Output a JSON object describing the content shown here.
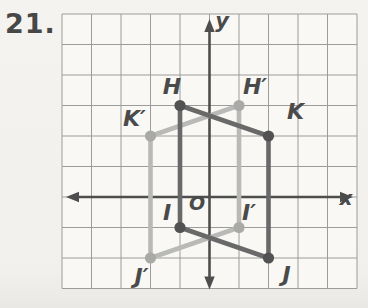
{
  "problem_number": "21.",
  "colors": {
    "page_bg": "#f1f0ed",
    "grid_bg": "#f9f8f5",
    "grid_line": "#9c9c9a",
    "axis": "#4e4e4e",
    "label": "#4a4a4a",
    "preimage_line": "#696969",
    "preimage_dot": "#525252",
    "image_line": "#b9b9b7",
    "image_dot": "#a9a9a7"
  },
  "figure": {
    "grid": {
      "cols": 10,
      "rows": 9,
      "left": 62,
      "top": 14,
      "cell_w": 29.5,
      "cell_h": 30.5,
      "origin_col": 5,
      "origin_row": 6,
      "x_range": [
        -5,
        5
      ],
      "y_range": [
        -3,
        6
      ]
    },
    "axes": {
      "x_label": "x",
      "y_label": "y",
      "origin_label": "O",
      "x_label_pos": [
        346,
        205
      ],
      "y_label_pos": [
        222,
        28
      ],
      "origin_label_pos": [
        197,
        210
      ]
    },
    "shapes": [
      {
        "id": "image-quad",
        "role": "reflected image H'K'J'I'",
        "line_color_key": "image_line",
        "dot_color_key": "image_dot",
        "points": [
          {
            "label": "H′",
            "x": 1,
            "y": 3,
            "label_offset": [
              16,
              -19
            ]
          },
          {
            "label": "K′",
            "x": -2,
            "y": 2,
            "label_offset": [
              -16,
              -18
            ]
          },
          {
            "label": "J′",
            "x": -2,
            "y": -2,
            "label_offset": [
              -9,
              18
            ]
          },
          {
            "label": "I′",
            "x": 1,
            "y": -1,
            "label_offset": [
              10,
              -15
            ]
          }
        ]
      },
      {
        "id": "preimage-quad",
        "role": "preimage HKJI",
        "line_color_key": "preimage_line",
        "dot_color_key": "preimage_dot",
        "points": [
          {
            "label": "H",
            "x": -1,
            "y": 3,
            "label_offset": [
              -8,
              -19
            ]
          },
          {
            "label": "K",
            "x": 2,
            "y": 2,
            "label_offset": [
              27,
              -25
            ]
          },
          {
            "label": "J",
            "x": 2,
            "y": -2,
            "label_offset": [
              18,
              16
            ]
          },
          {
            "label": "I",
            "x": -1,
            "y": -1,
            "label_offset": [
              -13,
              -15
            ]
          }
        ]
      }
    ]
  }
}
